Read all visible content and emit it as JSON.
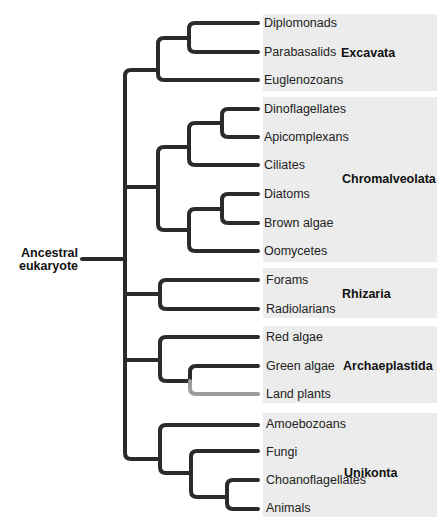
{
  "diagram": {
    "type": "phylogenetic-tree",
    "root_label_line1": "Ancestral",
    "root_label_line2": "eukaryote",
    "colors": {
      "branch": "#2b2b2b",
      "highlight_branch": "#9c9c9c",
      "group_box": "#ececec"
    },
    "groups": [
      {
        "name": "Excavata",
        "leaves": [
          "Diplomonads",
          "Parabasalids",
          "Euglenozoans"
        ]
      },
      {
        "name": "Chromalveolata",
        "leaves": [
          "Dinoflagellates",
          "Apicomplexans",
          "Ciliates",
          "Diatoms",
          "Brown algae",
          "Oomycetes"
        ]
      },
      {
        "name": "Rhizaria",
        "leaves": [
          "Forams",
          "Radiolarians"
        ]
      },
      {
        "name": "Archaeplastida",
        "leaves": [
          "Red algae",
          "Green algae",
          "Land plants"
        ]
      },
      {
        "name": "Unikonta",
        "leaves": [
          "Amoebozoans",
          "Fungi",
          "Choanoflagellates",
          "Animals"
        ]
      }
    ],
    "highlighted_leaf": "Land plants"
  }
}
